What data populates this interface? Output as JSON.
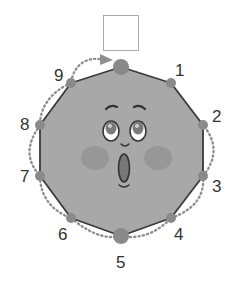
{
  "figure": {
    "answer_box": "",
    "vertex_labels": [
      "1",
      "2",
      "3",
      "4",
      "5",
      "6",
      "7",
      "8",
      "9"
    ],
    "colors": {
      "face_fill": "#a8a8a8",
      "edge": "#3a3a3a",
      "vertex_dot": "#8a8a8a",
      "dotted_path": "#8f8f8f",
      "cheek": "#979797",
      "box_border": "#aaaaaa"
    }
  }
}
